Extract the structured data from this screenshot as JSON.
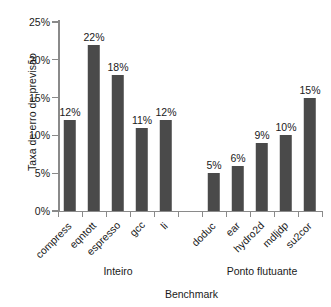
{
  "chart_data": {
    "type": "bar",
    "title": "",
    "xlabel": "Benchmark",
    "ylabel": "Taxa de erro de previsão",
    "ylim": [
      0,
      25
    ],
    "ytick_labels": [
      "0%",
      "5%",
      "10%",
      "15%",
      "20%",
      "25%"
    ],
    "ytick_values": [
      0,
      5,
      10,
      15,
      20,
      25
    ],
    "grid": false,
    "legend": "none",
    "value_label_suffix": "%",
    "bar_color": "#4a4a4a",
    "axis_color": "#8a8a8a",
    "categories": [
      "compress",
      "eqntott",
      "espresso",
      "gcc",
      "li",
      "doduc",
      "ear",
      "hydro2d",
      "mdljdp",
      "su2cor"
    ],
    "values": [
      12,
      22,
      18,
      11,
      12,
      5,
      6,
      9,
      10,
      15
    ],
    "value_labels": [
      "12%",
      "22%",
      "18%",
      "11%",
      "12%",
      "5%",
      "6%",
      "9%",
      "10%",
      "15%"
    ],
    "groups": [
      {
        "label": "Inteiro",
        "categories": [
          "compress",
          "eqntott",
          "espresso",
          "gcc",
          "li"
        ]
      },
      {
        "label": "Ponto flutuante",
        "categories": [
          "doduc",
          "ear",
          "hydro2d",
          "mdljdp",
          "su2cor"
        ]
      }
    ]
  }
}
